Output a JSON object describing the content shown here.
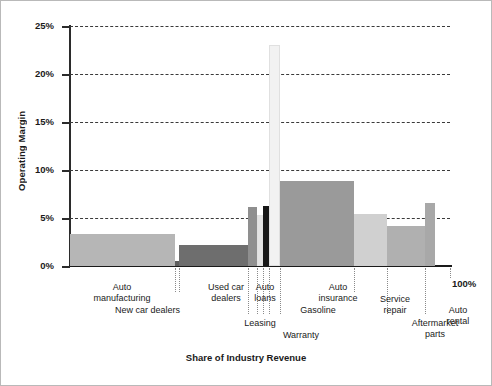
{
  "chart_data": {
    "type": "bar",
    "title": "",
    "subtitle": "",
    "xlabel": "Share of Industry Revenue",
    "ylabel": "Operating Margin",
    "ylim": [
      0,
      25
    ],
    "xlim": [
      0,
      100
    ],
    "grid": true,
    "legend": "none",
    "y_ticks": [
      "0%",
      "5%",
      "10%",
      "15%",
      "20%",
      "25%"
    ],
    "y_tick_values": [
      0,
      5,
      10,
      15,
      20,
      25
    ],
    "x_end_label": "100%",
    "note": "Marimekko-style chart: bar width = share of industry revenue, bar height = operating margin",
    "categories": [
      "Auto manufacturing",
      "New car dealers",
      "Used car dealers",
      "Auto loans",
      "Leasing",
      "Warranty",
      "Gasoline",
      "Auto insurance",
      "Service repair",
      "Aftermarket parts",
      "Auto rental"
    ],
    "values": [
      3.3,
      0.5,
      2.2,
      6.1,
      5.3,
      6.2,
      23.0,
      8.9,
      5.4,
      4.2,
      6.6
    ],
    "widths": [
      27.5,
      1.3,
      18.0,
      2.4,
      1.6,
      1.6,
      2.8,
      19.5,
      8.7,
      10.0,
      2.6
    ],
    "x_starts": [
      0.0,
      27.5,
      28.8,
      46.8,
      49.2,
      50.8,
      52.4,
      55.2,
      74.7,
      83.4,
      93.4
    ],
    "colors": [
      "#b6b6b6",
      "#5d5d5d",
      "#6e6e6e",
      "#8f8f8f",
      "#e3e3e3",
      "#171717",
      "#f2f2f2",
      "#9a9a9a",
      "#d0d0d0",
      "#b0b0b0",
      "#a8a8a8"
    ],
    "series": [
      {
        "name": "Operating Margin",
        "values": [
          3.3,
          0.5,
          2.2,
          6.1,
          5.3,
          6.2,
          23.0,
          8.9,
          5.4,
          4.2,
          6.6
        ]
      }
    ]
  },
  "labels": {
    "auto_manufacturing": "Auto\nmanufacturing",
    "new_car_dealers": "New car dealers",
    "used_car_dealers": "Used car\ndealers",
    "auto_loans": "Auto\nloans",
    "leasing": "Leasing",
    "warranty": "Warranty",
    "gasoline": "Gasoline",
    "auto_insurance": "Auto\ninsurance",
    "service_repair": "Service\nrepair",
    "aftermarket_parts": "Aftermarket\nparts",
    "auto_rental": "Auto\nrental"
  },
  "axis": {
    "y_title": "Operating Margin",
    "x_title": "Share of Industry Revenue",
    "tick_0": "0%",
    "tick_5": "5%",
    "tick_10": "10%",
    "tick_15": "15%",
    "tick_20": "20%",
    "tick_25": "25%",
    "x_end": "100%"
  }
}
